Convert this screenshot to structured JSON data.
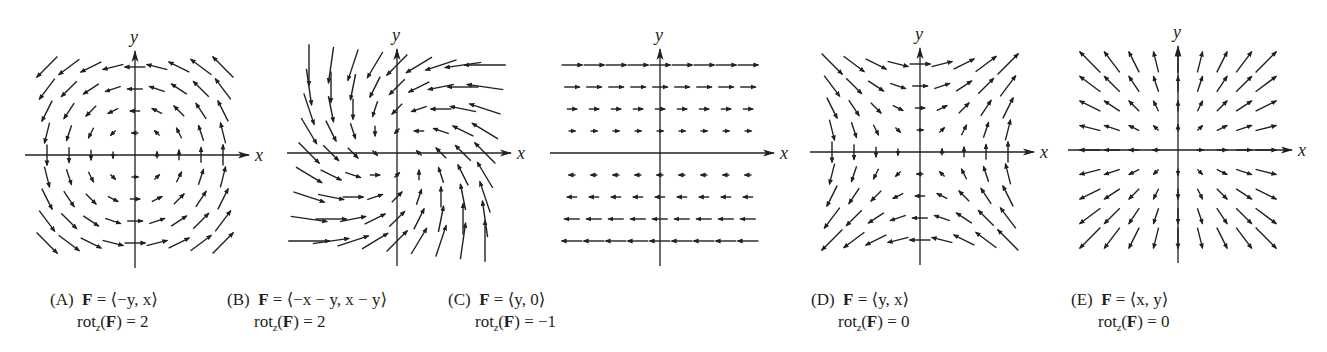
{
  "figure": {
    "panels": [
      {
        "id": "A",
        "label": "(A)",
        "field_lhs": "F",
        "field_rhs": "= ⟨−y, x⟩",
        "rot_lhs": "rot",
        "rot_sub": "z",
        "rot_arg": "F",
        "rot_value": "= 2",
        "field": {
          "fx": "-y",
          "fy": "x"
        },
        "axis_x_label": "x",
        "axis_y_label": "y",
        "grid": [
          -4,
          -3,
          -2,
          -1,
          0,
          1,
          2,
          3,
          4
        ]
      },
      {
        "id": "B",
        "label": "(B)",
        "field_lhs": "F",
        "field_rhs": "= ⟨−x − y, x − y⟩",
        "rot_lhs": "rot",
        "rot_sub": "z",
        "rot_arg": "F",
        "rot_value": "= 2",
        "field": {
          "fx": "-x-y",
          "fy": "x-y"
        },
        "axis_x_label": "x",
        "axis_y_label": "y",
        "grid": [
          -4,
          -3,
          -2,
          -1,
          0,
          1,
          2,
          3,
          4
        ]
      },
      {
        "id": "C",
        "label": "(C)",
        "field_lhs": "F",
        "field_rhs": "= ⟨y, 0⟩",
        "rot_lhs": "rot",
        "rot_sub": "z",
        "rot_arg": "F",
        "rot_value": "= −1",
        "field": {
          "fx": "y",
          "fy": "0"
        },
        "axis_x_label": "x",
        "axis_y_label": "y",
        "grid": [
          -4,
          -3,
          -2,
          -1,
          0,
          1,
          2,
          3,
          4
        ]
      },
      {
        "id": "D",
        "label": "(D)",
        "field_lhs": "F",
        "field_rhs": "= ⟨y, x⟩",
        "rot_lhs": "rot",
        "rot_sub": "z",
        "rot_arg": "F",
        "rot_value": "= 0",
        "field": {
          "fx": "y",
          "fy": "x"
        },
        "axis_x_label": "x",
        "axis_y_label": "y",
        "grid": [
          -4,
          -3,
          -2,
          -1,
          0,
          1,
          2,
          3,
          4
        ]
      },
      {
        "id": "E",
        "label": "(E)",
        "field_lhs": "F",
        "field_rhs": "= ⟨x, y⟩",
        "rot_lhs": "rot",
        "rot_sub": "z",
        "rot_arg": "F",
        "rot_value": "= 0",
        "field": {
          "fx": "x",
          "fy": "y"
        },
        "axis_x_label": "x",
        "axis_y_label": "y",
        "grid": [
          -4,
          -3,
          -2,
          -1,
          0,
          1,
          2,
          3,
          4
        ]
      }
    ],
    "colors": {
      "ink": "#231f20",
      "background": "#ffffff"
    }
  }
}
